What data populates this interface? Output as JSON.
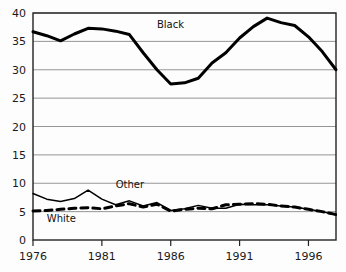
{
  "chart_data": {
    "type": "line",
    "title": "",
    "subtitle": "",
    "xlabel": "",
    "ylabel": "",
    "xlim": [
      1976,
      1998
    ],
    "ylim": [
      0,
      40
    ],
    "grid": true,
    "grid_axis": "y",
    "legend_position": "inline-annotation",
    "x": [
      1976,
      1977,
      1978,
      1979,
      1980,
      1981,
      1982,
      1983,
      1984,
      1985,
      1986,
      1987,
      1988,
      1989,
      1990,
      1991,
      1992,
      1993,
      1994,
      1995,
      1996,
      1997,
      1998
    ],
    "xticks": [
      1976,
      1981,
      1986,
      1991,
      1996
    ],
    "xticklabels": [
      "1976",
      "1981",
      "1986",
      "1991",
      "1996"
    ],
    "yticks": [
      0,
      5,
      10,
      15,
      20,
      25,
      30,
      35,
      40
    ],
    "yticklabels": [
      "0",
      "5",
      "10",
      "15",
      "20",
      "25",
      "30",
      "35",
      "40"
    ],
    "series": [
      {
        "name": "Black",
        "label": "Black",
        "color": "#000000",
        "linestyle": "solid",
        "linewidth": 3,
        "values": [
          36.7,
          36.0,
          35.1,
          36.3,
          37.3,
          37.2,
          36.8,
          36.2,
          33.0,
          30.0,
          27.5,
          27.7,
          28.5,
          31.2,
          33.0,
          35.6,
          37.6,
          39.1,
          38.3,
          37.8,
          35.8,
          33.2,
          30.0
        ],
        "label_x": 1985,
        "label_y": 37.3
      },
      {
        "name": "Other",
        "label": "Other",
        "color": "#000000",
        "linestyle": "solid",
        "linewidth": 1.5,
        "values": [
          8.2,
          7.2,
          6.8,
          7.3,
          8.8,
          7.2,
          6.2,
          6.9,
          6.0,
          6.6,
          5.2,
          5.5,
          6.1,
          5.6,
          5.6,
          6.3,
          6.2,
          6.2,
          6.0,
          5.8,
          5.4,
          5.0,
          4.4
        ],
        "label_x": 1982,
        "label_y": 9.2
      },
      {
        "name": "White",
        "label": "White",
        "color": "#000000",
        "linestyle": "dashed",
        "linewidth": 3,
        "values": [
          5.1,
          5.2,
          5.4,
          5.6,
          5.7,
          5.5,
          6.0,
          6.4,
          5.8,
          6.3,
          5.1,
          5.4,
          5.6,
          5.5,
          6.2,
          6.3,
          6.4,
          6.3,
          6.0,
          5.8,
          5.4,
          5.0,
          4.5
        ],
        "label_x": 1977,
        "label_y": 3.1
      }
    ],
    "annotations": [
      {
        "text": "Black",
        "x": 1985,
        "y": 37.3
      },
      {
        "text": "Other",
        "x": 1982,
        "y": 9.2
      },
      {
        "text": "White",
        "x": 1977,
        "y": 3.1
      }
    ]
  },
  "axes": {
    "plot_area": {
      "left": 33,
      "top": 13,
      "right": 336,
      "bottom": 240
    },
    "frame_color": "#222222",
    "grid_color": "#8a8a8a"
  }
}
